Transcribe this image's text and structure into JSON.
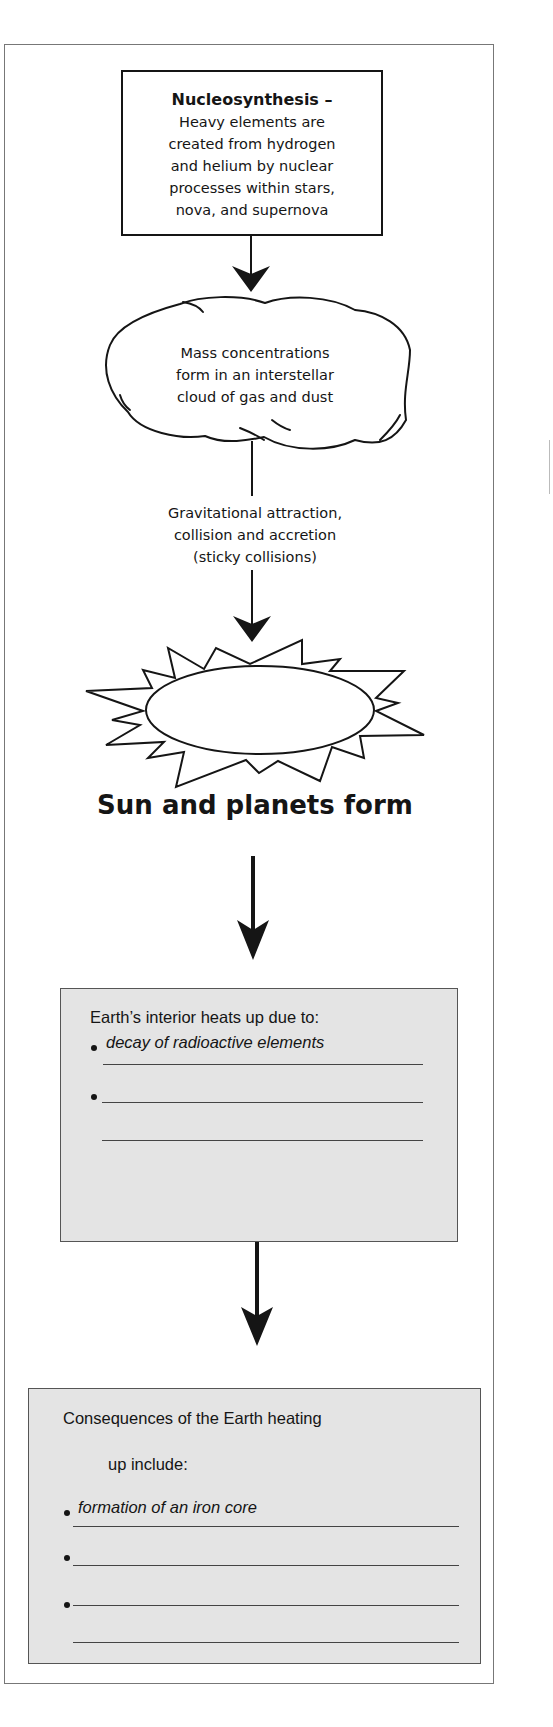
{
  "diagram": {
    "type": "flowchart",
    "colors": {
      "stroke": "#151515",
      "box_fill": "#e4e4e4",
      "frame": "#777777"
    },
    "nodes": [
      {
        "id": "nucleosynthesis",
        "shape": "rectangle",
        "title": "Nucleosynthesis –",
        "lines": [
          "Heavy elements are",
          "created from hydrogen",
          "and helium by nuclear",
          "processes within stars,",
          "nova, and supernova"
        ]
      },
      {
        "id": "mass-concentrations",
        "shape": "cloud",
        "lines": [
          "Mass concentrations",
          "form in an interstellar",
          "cloud of gas and dust"
        ]
      },
      {
        "id": "sun-planets",
        "shape": "starburst",
        "label": "Sun and planets form"
      },
      {
        "id": "earth-heats",
        "shape": "shaded-box",
        "heading": "Earth’s interior heats up due to:",
        "bullets": [
          "decay of radioactive elements",
          "",
          ""
        ]
      },
      {
        "id": "consequences",
        "shape": "shaded-box",
        "heading_line1": "Consequences of the Earth heating",
        "heading_line2": "up include:",
        "bullets": [
          "formation of an iron core",
          "",
          "",
          ""
        ]
      }
    ],
    "edges": [
      {
        "from": "nucleosynthesis",
        "to": "mass-concentrations",
        "label": ""
      },
      {
        "from": "mass-concentrations",
        "to": "sun-planets",
        "label_lines": [
          "Gravitational attraction,",
          "collision and accretion",
          "(sticky collisions)"
        ]
      },
      {
        "from": "sun-planets",
        "to": "earth-heats",
        "label": ""
      },
      {
        "from": "earth-heats",
        "to": "consequences",
        "label": ""
      }
    ]
  }
}
